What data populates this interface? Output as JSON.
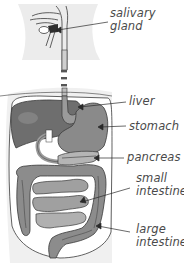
{
  "diagram": {
    "colors": {
      "background": "#ffffff",
      "body_shade": "#ebebeb",
      "outline": "#3a3a3a",
      "liver": "#6e6e6e",
      "stomach": "#8a8a8a",
      "pancreas": "#b5b5b5",
      "small_intestine": "#a0a0a0",
      "large_intestine": "#8c8c8c",
      "esophagus": "#9a9a9a",
      "label_text": "#4a4a4a",
      "leader_line": "#2a2a2a"
    },
    "labels": [
      {
        "id": "salivary-gland",
        "line1": "salivary",
        "line2": "gland"
      },
      {
        "id": "liver",
        "line1": "liver"
      },
      {
        "id": "stomach",
        "line1": "stomach"
      },
      {
        "id": "pancreas",
        "line1": "pancreas"
      },
      {
        "id": "small-intestine",
        "line1": "small",
        "line2": "intestine"
      },
      {
        "id": "large-intestine",
        "line1": "large",
        "line2": "intestine"
      }
    ]
  }
}
